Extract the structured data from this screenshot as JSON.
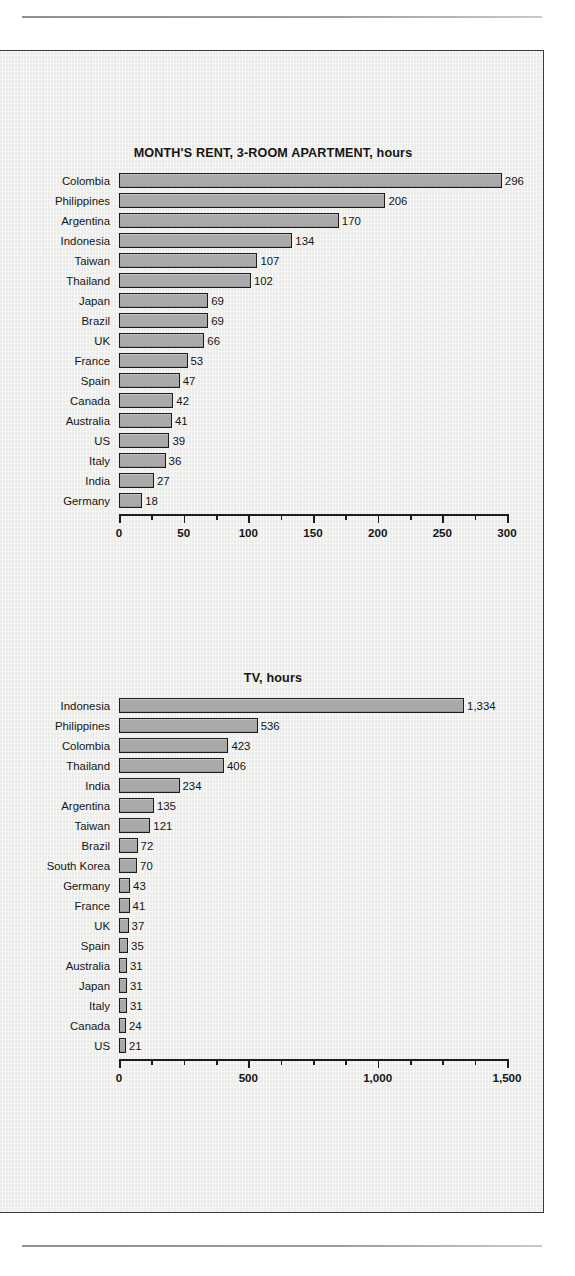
{
  "page": {
    "top_rule": "horizontal-rule",
    "bottom_rule": "horizontal-rule"
  },
  "chart_data": [
    {
      "id": "rent",
      "type": "bar",
      "orientation": "horizontal",
      "title": "MONTH'S RENT, 3-ROOM APARTMENT, hours",
      "xlabel": "",
      "ylabel": "",
      "unit": "hours",
      "xlim": [
        0,
        300
      ],
      "xticks": [
        0,
        50,
        100,
        150,
        200,
        250,
        300
      ],
      "xtick_labels": [
        "0",
        "50",
        "100",
        "150",
        "200",
        "250",
        "300"
      ],
      "minor_tick_step": 25,
      "grid": false,
      "legend": "none",
      "bar_color": "#a9a9a9",
      "bar_border_color": "#1c1c1c",
      "categories": [
        "Colombia",
        "Philippines",
        "Argentina",
        "Indonesia",
        "Taiwan",
        "Thailand",
        "Japan",
        "Brazil",
        "UK",
        "France",
        "Spain",
        "Canada",
        "Australia",
        "US",
        "Italy",
        "India",
        "Germany"
      ],
      "values": [
        296,
        206,
        170,
        134,
        107,
        102,
        69,
        69,
        66,
        53,
        47,
        42,
        41,
        39,
        36,
        27,
        18
      ],
      "value_labels": [
        "296",
        "206",
        "170",
        "134",
        "107",
        "102",
        "69",
        "69",
        "66",
        "53",
        "47",
        "42",
        "41",
        "39",
        "36",
        "27",
        "18"
      ]
    },
    {
      "id": "tv",
      "type": "bar",
      "orientation": "horizontal",
      "title": "TV, hours",
      "xlabel": "",
      "ylabel": "",
      "unit": "hours",
      "xlim": [
        0,
        1500
      ],
      "xticks": [
        0,
        500,
        1000,
        1500
      ],
      "xtick_labels": [
        "0",
        "500",
        "1,000",
        "1,500"
      ],
      "minor_tick_step": 125,
      "grid": false,
      "legend": "none",
      "bar_color": "#a9a9a9",
      "bar_border_color": "#1c1c1c",
      "categories": [
        "Indonesia",
        "Philippines",
        "Colombia",
        "Thailand",
        "India",
        "Argentina",
        "Taiwan",
        "Brazil",
        "South Korea",
        "Germany",
        "France",
        "UK",
        "Spain",
        "Australia",
        "Japan",
        "Italy",
        "Canada",
        "US"
      ],
      "values": [
        1334,
        536,
        423,
        406,
        234,
        135,
        121,
        72,
        70,
        43,
        41,
        37,
        35,
        31,
        31,
        31,
        24,
        21
      ],
      "value_labels": [
        "1,334",
        "536",
        "423",
        "406",
        "234",
        "135",
        "121",
        "72",
        "70",
        "43",
        "41",
        "37",
        "35",
        "31",
        "31",
        "31",
        "24",
        "21"
      ]
    }
  ]
}
